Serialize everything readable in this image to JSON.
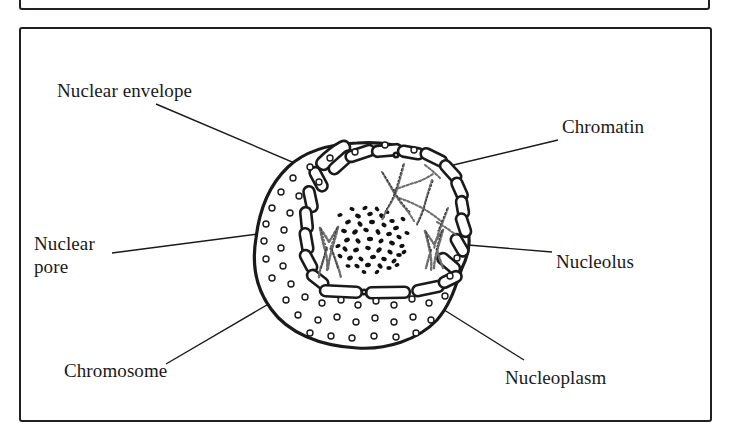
{
  "figure": {
    "kind": "biology-diagram",
    "background_color": "#ffffff",
    "ink_color": "#231f20",
    "frames": [
      {
        "name": "upper-frame-partial",
        "border_color": "#231f20"
      },
      {
        "name": "main-frame",
        "border_color": "#231f20"
      }
    ],
    "labels": [
      {
        "id": "nuclear-envelope",
        "text": "Nuclear envelope"
      },
      {
        "id": "chromatin",
        "text": "Chromatin"
      },
      {
        "id": "nuclear-pore",
        "text": "Nuclear\npore"
      },
      {
        "id": "nucleolus",
        "text": "Nucleolus"
      },
      {
        "id": "chromosome",
        "text": "Chromosome"
      },
      {
        "id": "nucleoplasm",
        "text": "Nucleoplasm"
      }
    ],
    "parts": [
      {
        "id": "nuclear-envelope",
        "description": "double membrane drawn as chain of elongated capsule segments"
      },
      {
        "id": "nuclear-pore",
        "description": "small open circles scattered across the outer membrane"
      },
      {
        "id": "nucleolus",
        "description": "dense stippled dark sphere at centre"
      },
      {
        "id": "chromatin",
        "description": "thin beaded wavy strands in upper right of inner region"
      },
      {
        "id": "chromosome",
        "description": "condensed X-shaped beaded strands flanking the nucleolus"
      },
      {
        "id": "nucleoplasm",
        "description": "clear interior region enclosed by the envelope"
      }
    ]
  }
}
